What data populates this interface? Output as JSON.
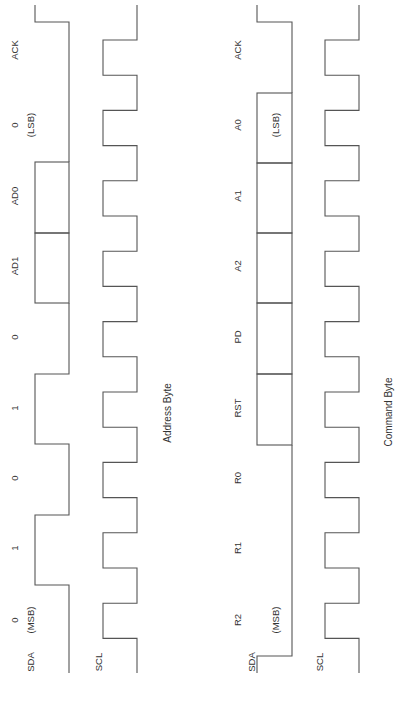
{
  "diagrams": [
    {
      "title": "Address Byte",
      "title_pos": [
        167,
        413
      ],
      "sda_label": "SDA",
      "scl_label": "SCL",
      "sda_label_pos": [
        30,
        662
      ],
      "scl_label_pos": [
        98,
        662
      ],
      "bits": [
        {
          "label": "0",
          "sub": "(MSB)",
          "value": "0"
        },
        {
          "label": "1",
          "sub": "",
          "value": "1"
        },
        {
          "label": "0",
          "sub": "",
          "value": "0"
        },
        {
          "label": "1",
          "sub": "",
          "value": "1"
        },
        {
          "label": "0",
          "sub": "",
          "value": "0"
        },
        {
          "label": "AD1",
          "sub": "",
          "value": "X"
        },
        {
          "label": "AD0",
          "sub": "",
          "value": "X"
        },
        {
          "label": "0",
          "sub": "(LSB)",
          "value": "0"
        },
        {
          "label": "ACK",
          "sub": "",
          "value": "0"
        }
      ],
      "label_x": 14,
      "sub_x": 30,
      "sub_inside_box": false,
      "sda": {
        "high_x": 35,
        "low_x": 69
      },
      "scl": {
        "high_x": 137,
        "low_x": 103
      }
    },
    {
      "title": "Command Byte",
      "title_pos": [
        388,
        412
      ],
      "sda_label": "SDA",
      "scl_label": "SCL",
      "sda_label_pos": [
        251,
        662
      ],
      "scl_label_pos": [
        319,
        662
      ],
      "bits": [
        {
          "label": "R2",
          "sub": "(MSB)",
          "value": "0"
        },
        {
          "label": "R1",
          "sub": "",
          "value": "0"
        },
        {
          "label": "R0",
          "sub": "",
          "value": "0"
        },
        {
          "label": "RST",
          "sub": "",
          "value": "X"
        },
        {
          "label": "PD",
          "sub": "",
          "value": "X"
        },
        {
          "label": "A2",
          "sub": "",
          "value": "X"
        },
        {
          "label": "A1",
          "sub": "",
          "value": "X"
        },
        {
          "label": "A0",
          "sub": "(LSB)",
          "value": "X"
        },
        {
          "label": "ACK",
          "sub": "",
          "value": "0"
        }
      ],
      "label_x": 237,
      "sub_x": 275,
      "sub_inside_box": true,
      "sda": {
        "high_x": 257,
        "low_x": 292
      },
      "scl": {
        "high_x": 359,
        "low_x": 325
      }
    }
  ],
  "timing": {
    "top_y": 5,
    "bottom_y": 673,
    "first_edge_y": 22,
    "scl_first_fall_y": 40,
    "half_period": 35.2,
    "bit_boundaries_left": [
      672,
      585,
      515,
      444,
      374,
      303,
      233,
      162,
      92,
      22
    ],
    "bit_boundaries_right": [
      656,
      585,
      515,
      445,
      374,
      303,
      233,
      163,
      93,
      22
    ],
    "label_centers": [
      620,
      548,
      478,
      408,
      337,
      266,
      196,
      125,
      50
    ]
  },
  "colors": {
    "line": "#555555",
    "text": "#333333",
    "background": "#ffffff"
  }
}
